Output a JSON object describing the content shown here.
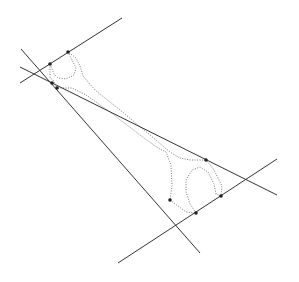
{
  "diagram": {
    "title": "",
    "colors": {
      "background": "#ffffff",
      "line": "#333333",
      "outline": "#777777",
      "point": "#222222"
    },
    "lines": [
      {
        "id": "upper-tangent",
        "x1": 20,
        "y1": 83,
        "x2": 122,
        "y2": 18
      },
      {
        "id": "steep-tangent",
        "x1": 21,
        "y1": 49,
        "x2": 200,
        "y2": 253
      },
      {
        "id": "shallow-tangent",
        "x1": 20,
        "y1": 67,
        "x2": 277,
        "y2": 195
      },
      {
        "id": "lower-tangent",
        "x1": 118,
        "y1": 263,
        "x2": 277,
        "y2": 159
      }
    ],
    "points": [
      {
        "id": "p1",
        "x": 68,
        "y": 52
      },
      {
        "id": "p2",
        "x": 50,
        "y": 64
      },
      {
        "id": "p3",
        "x": 52,
        "y": 83
      },
      {
        "id": "p4",
        "x": 57,
        "y": 88
      },
      {
        "id": "p5",
        "x": 206,
        "y": 160
      },
      {
        "id": "p6",
        "x": 221,
        "y": 196
      },
      {
        "id": "p7",
        "x": 170,
        "y": 200
      },
      {
        "id": "p8",
        "x": 196,
        "y": 213
      }
    ],
    "wrench_outline": "M50,64 L50,78 L53,80 L57,88 L72,88 L86,95 L110,112 L140,135 L158,148 L166,152 L171,165 L172,186 L170,200 L178,206 L186,212 L196,213 L190,204 L186,192 L186,180 L192,170 L200,167 L208,172 L214,184 L216,194 L221,196 L222,186 L214,170 L206,160 L190,160 L180,158 L170,152 L150,135 L120,110 L95,90 L83,76 L80,66 L76,58 L68,52 L72,60 L76,68 L74,75 L66,79 L58,78 L54,74 L50,64"
  }
}
